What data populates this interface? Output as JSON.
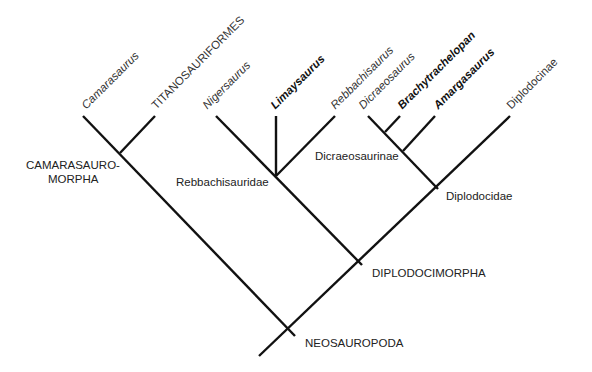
{
  "diagram": {
    "type": "cladogram",
    "taxa": [
      {
        "name": "Camarasaurus",
        "style": "italic"
      },
      {
        "name": "TITANOSAURIFORMES",
        "style": "normal"
      },
      {
        "name": "Nigersaurus",
        "style": "italic"
      },
      {
        "name": "Limaysaurus",
        "style": "bold-italic"
      },
      {
        "name": "Rebbachisaurus",
        "style": "italic"
      },
      {
        "name": "Dicraeosaurus",
        "style": "italic"
      },
      {
        "name": "Brachytrachelopan",
        "style": "bold-italic"
      },
      {
        "name": "Amargasaurus",
        "style": "bold-italic"
      },
      {
        "name": "Diplodocinae",
        "style": "normal"
      }
    ],
    "clades": {
      "camarasauromorpha_1": "CAMARASAURO-",
      "camarasauromorpha_2": "MORPHA",
      "rebbachisauridae": "Rebbachisauridae",
      "dicraeosaurinae": "Dicraeosaurinae",
      "diplodocidae": "Diplodocidae",
      "diplodocimorpha": "DIPLODOCIMORPHA",
      "neosauropoda": "NEOSAUROPODA"
    }
  }
}
